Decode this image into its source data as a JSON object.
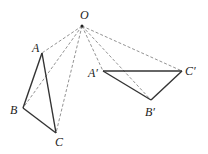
{
  "diagram": {
    "title": "",
    "points": {
      "O": {
        "label": "O",
        "x": 82,
        "y": 26,
        "lx": 80,
        "ly": 19
      },
      "A": {
        "label": "A",
        "x": 42,
        "y": 53,
        "lx": 32,
        "ly": 52
      },
      "B": {
        "label": "B",
        "x": 23,
        "y": 108,
        "lx": 10,
        "ly": 114
      },
      "C": {
        "label": "C",
        "x": 56,
        "y": 133,
        "lx": 55,
        "ly": 146
      },
      "A1": {
        "label": "A′",
        "x": 103,
        "y": 71,
        "lx": 88,
        "ly": 77
      },
      "B1": {
        "label": "B′",
        "x": 151,
        "y": 100,
        "lx": 145,
        "ly": 116
      },
      "C1": {
        "label": "C′",
        "x": 182,
        "y": 71,
        "lx": 185,
        "ly": 75
      }
    },
    "solid_segments": [
      [
        "A",
        "B"
      ],
      [
        "B",
        "C"
      ],
      [
        "C",
        "A"
      ],
      [
        "A1",
        "B1"
      ],
      [
        "B1",
        "C1"
      ],
      [
        "C1",
        "A1"
      ]
    ],
    "dashed_segments": [
      [
        "O",
        "A"
      ],
      [
        "O",
        "B"
      ],
      [
        "O",
        "C"
      ],
      [
        "O",
        "A1"
      ],
      [
        "O",
        "B1"
      ],
      [
        "O",
        "C1"
      ]
    ],
    "colors": {
      "solid": "#333333",
      "dashed": "#777777",
      "point": "#222222"
    }
  }
}
